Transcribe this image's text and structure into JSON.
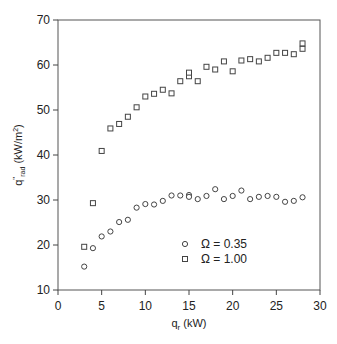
{
  "chart_data": {
    "type": "scatter",
    "title": "",
    "xlabel": {
      "main": "q",
      "sub": "r",
      "unit": " (kW)"
    },
    "ylabel": {
      "main": "q",
      "sup": "\"",
      "sub": "rad",
      "unit": " (kW/m",
      "unit_sup": "2",
      "unit_close": ")"
    },
    "xlim": [
      0,
      30
    ],
    "ylim": [
      10,
      70
    ],
    "xticks": [
      0,
      5,
      10,
      15,
      20,
      25,
      30
    ],
    "yticks": [
      10,
      20,
      30,
      40,
      50,
      60,
      70
    ],
    "xtick_labels": [
      "0",
      "5",
      "10",
      "15",
      "20",
      "25",
      "30"
    ],
    "ytick_labels": [
      "10",
      "20",
      "30",
      "40",
      "50",
      "60",
      "70"
    ],
    "grid": false,
    "legend_position": "bottom-center",
    "series": [
      {
        "name": "Ω = 0.35",
        "marker": "circle",
        "x": [
          3,
          4,
          5,
          6,
          7,
          8,
          9,
          10,
          11,
          12,
          13,
          14,
          15,
          15,
          16,
          17,
          18,
          19,
          20,
          21,
          22,
          23,
          24,
          25,
          26,
          27,
          28
        ],
        "y": [
          15.2,
          19.3,
          21.9,
          23.0,
          25.1,
          25.6,
          28.3,
          29.1,
          29.0,
          29.8,
          31.0,
          31.0,
          31.1,
          30.7,
          30.2,
          30.9,
          32.4,
          30.2,
          30.9,
          32.1,
          30.2,
          30.7,
          30.9,
          30.7,
          29.6,
          29.8,
          30.6
        ]
      },
      {
        "name": "Ω = 1.00",
        "marker": "square",
        "x": [
          3,
          4,
          5,
          6,
          7,
          8,
          9,
          10,
          11,
          12,
          13,
          14,
          15,
          15,
          16,
          17,
          18,
          19,
          20,
          21,
          22,
          23,
          24,
          25,
          26,
          27,
          28,
          28
        ],
        "y": [
          19.6,
          29.3,
          40.9,
          45.9,
          46.9,
          48.5,
          50.6,
          53.0,
          53.6,
          54.5,
          53.7,
          56.4,
          57.5,
          58.3,
          56.4,
          59.6,
          59.0,
          60.8,
          58.6,
          61.0,
          61.3,
          60.8,
          61.6,
          62.7,
          62.7,
          62.4,
          63.6,
          64.8
        ]
      }
    ]
  }
}
